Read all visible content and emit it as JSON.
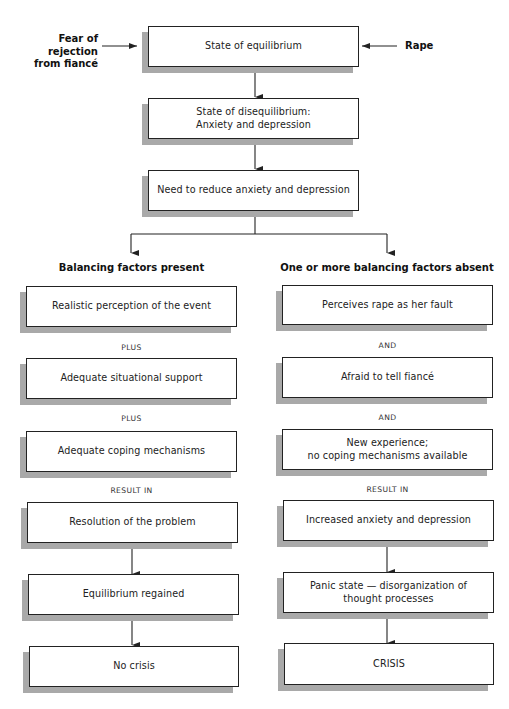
{
  "diagram": {
    "type": "crisis-intervention-flowchart",
    "inputs": {
      "left": "Fear of rejection\nfrom fiancé",
      "right": "Rape"
    },
    "center": [
      {
        "id": "c1",
        "text": "State of equilibrium"
      },
      {
        "id": "c2",
        "text": "State of disequilibrium:\nAnxiety and depression"
      },
      {
        "id": "c3",
        "text": "Need to reduce anxiety and depression"
      }
    ],
    "branches": {
      "left": {
        "heading": "Balancing factors present",
        "boxes": [
          "Realistic perception of the event",
          "Adequate situational support",
          "Adequate coping mechanisms",
          "Resolution of the problem",
          "Equilibrium regained",
          "No crisis"
        ],
        "connectors": [
          "PLUS",
          "PLUS",
          "RESULT IN"
        ]
      },
      "right": {
        "heading": "One or more balancing factors absent",
        "boxes": [
          "Perceives rape as her fault",
          "Afraid to tell fiancé",
          "New experience;\nno coping mechanisms available",
          "Increased anxiety and depression",
          "Panic state — disorganization of\nthought processes",
          "CRISIS"
        ],
        "connectors": [
          "AND",
          "AND",
          "RESULT IN"
        ]
      }
    },
    "colors": {
      "line": "#222222",
      "shadow": "#a9a9a9",
      "background": "#ffffff"
    }
  }
}
